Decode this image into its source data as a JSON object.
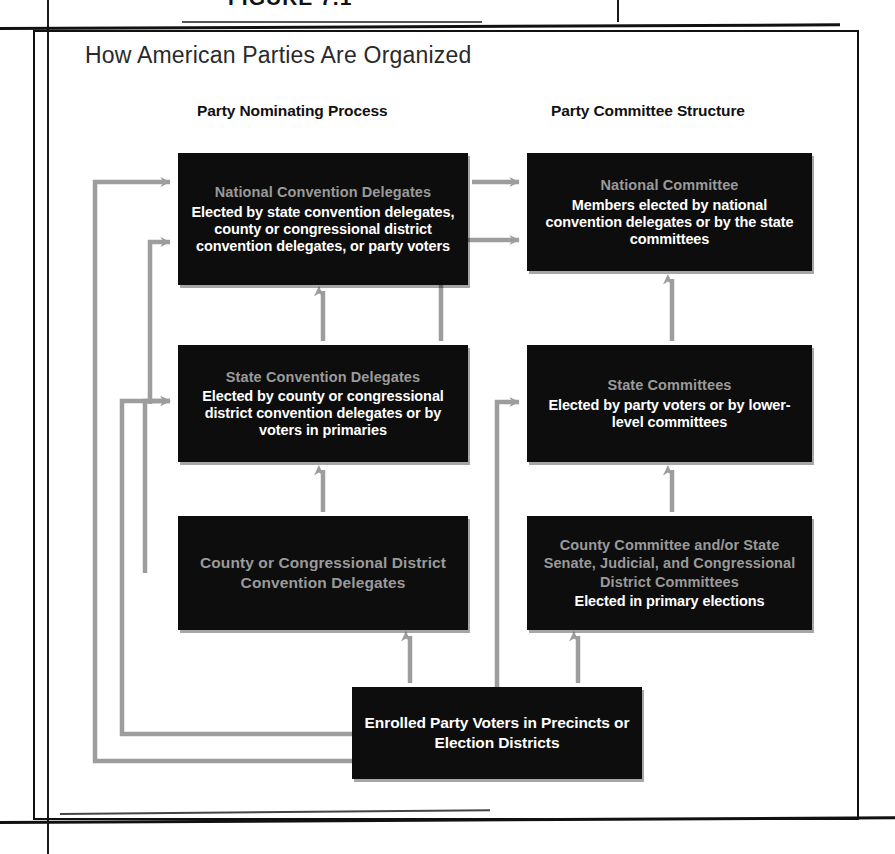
{
  "figure": {
    "caption": "FIGURE 7.1",
    "title": "How American Parties Are Organized"
  },
  "columns": [
    {
      "id": "nominating",
      "label": "Party Nominating Process"
    },
    {
      "id": "committee",
      "label": "Party Committee Structure"
    }
  ],
  "nodes": [
    {
      "id": "national-convention-delegates",
      "column": "nominating",
      "title": "National Convention Delegates",
      "body": "Elected by state convention delegates, county or congressional district convention delegates, or party voters",
      "x": 178,
      "y": 153,
      "w": 290,
      "h": 132
    },
    {
      "id": "national-committee",
      "column": "committee",
      "title": "National Committee",
      "body": "Members elected by national convention delegates or by the state committees",
      "x": 527,
      "y": 153,
      "w": 285,
      "h": 118
    },
    {
      "id": "state-convention-delegates",
      "column": "nominating",
      "title": "State Convention Delegates",
      "body": "Elected by county or congressional district convention delegates or by voters in primaries",
      "x": 178,
      "y": 345,
      "w": 290,
      "h": 117
    },
    {
      "id": "state-committees",
      "column": "committee",
      "title": "State Committees",
      "body": "Elected by party voters or by lower-level committees",
      "x": 527,
      "y": 345,
      "w": 285,
      "h": 117
    },
    {
      "id": "county-or-congressional-district-convention-delegates",
      "column": "nominating",
      "title": "County or Congressional District Convention Delegates",
      "body": "",
      "x": 178,
      "y": 516,
      "w": 290,
      "h": 114
    },
    {
      "id": "county-committee-and-district-committees",
      "column": "committee",
      "title": "County Committee and/or State Senate, Judicial, and Congressional District Committees",
      "body": "Elected in primary elections",
      "x": 527,
      "y": 516,
      "w": 285,
      "h": 114
    },
    {
      "id": "enrolled-party-voters",
      "column": "base",
      "title": "",
      "body": "Enrolled Party Voters in Precincts or Election Districts",
      "x": 352,
      "y": 687,
      "w": 290,
      "h": 92
    }
  ],
  "connectors": [
    {
      "id": "voters-to-national-convention-delegates",
      "from": "enrolled-party-voters",
      "to": "national-convention-delegates",
      "points": "352,761 95,761 95,182 170,182",
      "arrow": "right"
    },
    {
      "id": "voters-to-state-convention-delegates",
      "from": "enrolled-party-voters",
      "to": "state-convention-delegates",
      "points": "352,734 122,734 122,401 170,401",
      "arrow": "right"
    },
    {
      "id": "county-delegates-to-state-convention-delegates",
      "from": "county-or-congressional-district-convention-delegates",
      "to": "state-convention-delegates",
      "points": "145,573 145,401 170,401",
      "arrow": "right"
    },
    {
      "id": "state-delegates-to-national-convention-delegates",
      "from": "state-convention-delegates",
      "to": "national-convention-delegates",
      "points": "150,404 150,242 170,242",
      "arrow": "right"
    },
    {
      "id": "county-delegates-up-to-state-delegates",
      "from": "county-or-congressional-district-convention-delegates",
      "to": "state-convention-delegates",
      "points": "323,512 323,470",
      "arrow": "up"
    },
    {
      "id": "state-delegates-up-to-national-delegates",
      "from": "state-convention-delegates",
      "to": "national-convention-delegates",
      "points": "323,341 323,291",
      "arrow": "up"
    },
    {
      "id": "national-delegates-to-national-committee",
      "from": "national-convention-delegates",
      "to": "national-committee",
      "points": "472,182 519,182",
      "arrow": "right"
    },
    {
      "id": "state-delegates-to-national-committee",
      "from": "state-convention-delegates",
      "to": "national-committee",
      "points": "441,341 441,240 519,240",
      "arrow": "right"
    },
    {
      "id": "voters-to-state-committees",
      "from": "enrolled-party-voters",
      "to": "state-committees",
      "points": "497,687 497,402 519,402",
      "arrow": "right"
    },
    {
      "id": "voters-up-to-county-committees",
      "from": "enrolled-party-voters",
      "to": "county-committee-and-district-committees",
      "points": "578,683 578,636",
      "arrow": "up"
    },
    {
      "id": "county-committees-up-to-state-committees",
      "from": "county-committee-and-district-committees",
      "to": "state-committees",
      "points": "672,512 672,470",
      "arrow": "up"
    },
    {
      "id": "state-committees-up-to-national-committee",
      "from": "state-committees",
      "to": "national-committee",
      "points": "672,341 672,279",
      "arrow": "up"
    },
    {
      "id": "voters-up-to-county-delegates",
      "from": "enrolled-party-voters",
      "to": "county-or-congressional-district-convention-delegates",
      "points": "410,683 410,636",
      "arrow": "up"
    }
  ],
  "colors": {
    "node_fill": "#0d0d0d",
    "node_title_text": "#9a9a9a",
    "node_body_text": "#ffffff",
    "connector": "#9d9d9d",
    "frame": "#111111",
    "page_background": "#ffffff"
  }
}
